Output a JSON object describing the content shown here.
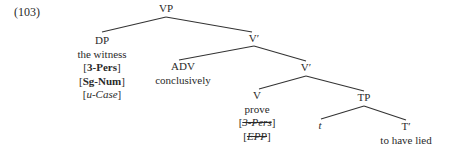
{
  "example_number": "(103)",
  "tree": {
    "vp": {
      "label": "VP"
    },
    "dp": {
      "label": "DP",
      "word": "the witness",
      "features": [
        {
          "open": "[",
          "text": "3-Pers",
          "close": "]",
          "style": "bold"
        },
        {
          "open": "[",
          "text": "Sg-Num",
          "close": "]",
          "style": "bold"
        },
        {
          "open": "[",
          "text": "u-Case",
          "close": "]",
          "style": "italic",
          "prefix": "u",
          "suffix": "-Case"
        }
      ]
    },
    "vbar1": {
      "label": "V′"
    },
    "adv": {
      "label": "ADV",
      "word": "conclusively"
    },
    "vbar2": {
      "label": "V′"
    },
    "v": {
      "label": "V",
      "word": "prove",
      "features": [
        {
          "open": "[",
          "text": "3-Pers",
          "close": "]",
          "style": "italic-strikethrough"
        },
        {
          "open": "[",
          "text": "EPP",
          "close": "]",
          "style": "italic-strikethrough"
        }
      ]
    },
    "tp": {
      "label": "TP"
    },
    "trace": {
      "label": "t"
    },
    "tbar": {
      "label": "T′",
      "word": "to have lied"
    }
  },
  "edges": [
    {
      "from": "VP",
      "to": "DP"
    },
    {
      "from": "VP",
      "to": "V′"
    },
    {
      "from": "V′",
      "to": "ADV"
    },
    {
      "from": "V′",
      "to": "V′"
    },
    {
      "from": "V′",
      "to": "V"
    },
    {
      "from": "V′",
      "to": "TP"
    },
    {
      "from": "TP",
      "to": "t"
    },
    {
      "from": "TP",
      "to": "T′"
    }
  ]
}
